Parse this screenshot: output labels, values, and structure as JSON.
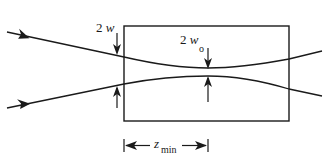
{
  "diagram": {
    "type": "gaussian-beam-focus-in-medium",
    "labels": {
      "input_width": "2w",
      "waist_width_main": "2w",
      "waist_width_sub": "o",
      "length_main": "z",
      "length_sub": "min"
    },
    "colors": {
      "line": "#1a1a1a",
      "background": "#ffffff"
    },
    "geometry": {
      "box": {
        "x1": 124,
        "y1": 26,
        "x2": 289,
        "y2": 121
      },
      "waist_x": 208,
      "upper_beam": {
        "start": [
          7,
          32
        ],
        "entry": [
          124,
          57
        ],
        "waist": [
          208,
          68
        ],
        "exit": [
          289,
          59
        ],
        "end": [
          322,
          51
        ]
      },
      "lower_beam": {
        "start": [
          7,
          108
        ],
        "entry": [
          124,
          84
        ],
        "waist": [
          208,
          76
        ],
        "exit": [
          289,
          89
        ],
        "end": [
          322,
          96
        ]
      }
    }
  }
}
